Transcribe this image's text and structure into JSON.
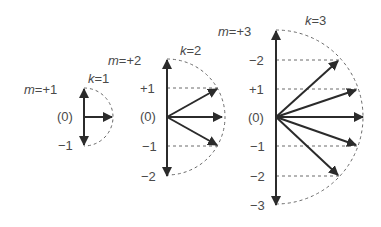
{
  "colors": {
    "line": "#2b2b2b",
    "dashed": "#6a6a6a",
    "label": "#4a4a4a",
    "background": "#ffffff"
  },
  "diagrams": [
    {
      "k_label": "k=1",
      "top_label": "m=+1",
      "center_label": "(0)",
      "levels": [
        "−1"
      ],
      "axis_x": 84,
      "center_y": 117,
      "radius": 29
    },
    {
      "k_label": "k=2",
      "top_label": "m=+2",
      "center_label": "(0)",
      "levels": [
        "+1",
        "−1",
        "−2"
      ],
      "axis_x": 167,
      "center_y": 117,
      "radius": 58
    },
    {
      "k_label": "k=3",
      "top_label": "m=+3",
      "center_label": "(0)",
      "levels": [
        "−2",
        "+1",
        "−1",
        "−2",
        "−3"
      ],
      "axis_x": 276,
      "center_y": 117,
      "radius": 87
    }
  ]
}
